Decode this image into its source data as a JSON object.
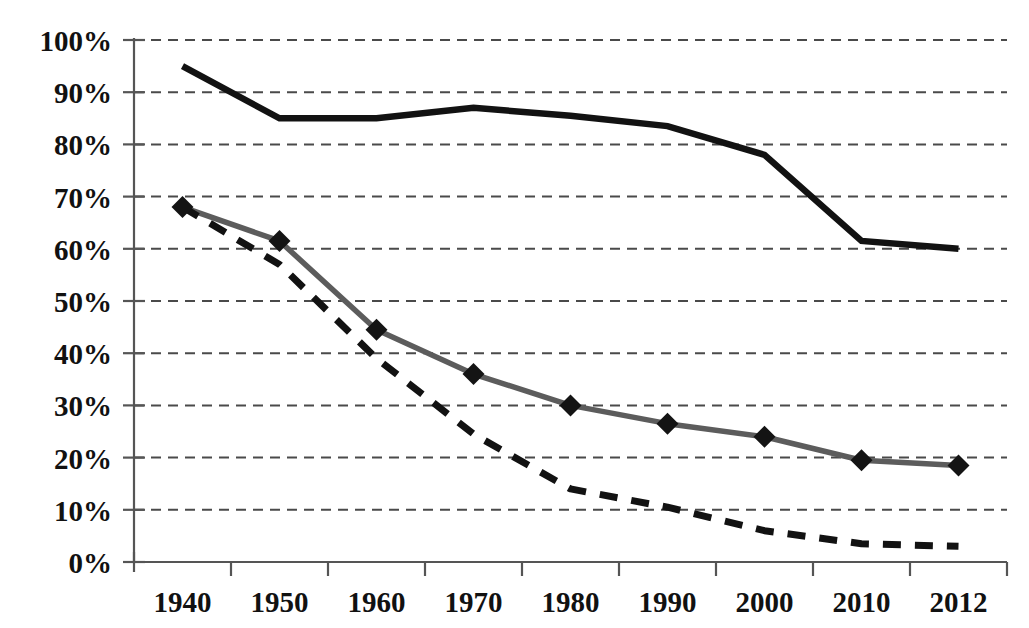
{
  "chart_data": {
    "type": "line",
    "title": "",
    "subtitle": "",
    "xlabel": "",
    "ylabel": "",
    "categories": [
      "1940",
      "1950",
      "1960",
      "1970",
      "1980",
      "1990",
      "2000",
      "2010",
      "2012"
    ],
    "x_tick_labels": [
      "1940",
      "1950",
      "1960",
      "1970",
      "1980",
      "1990",
      "2000",
      "2010",
      "2012"
    ],
    "y_tick_labels": [
      "0%",
      "10%",
      "20%",
      "30%",
      "40%",
      "50%",
      "60%",
      "70%",
      "80%",
      "90%",
      "100%"
    ],
    "y_tick_values": [
      0,
      10,
      20,
      30,
      40,
      50,
      60,
      70,
      80,
      90,
      100
    ],
    "ylim": [
      0,
      100
    ],
    "grid": true,
    "grid_orientation": "horizontal",
    "grid_style": "dashed",
    "legend": "none",
    "legend_position": "none",
    "annotations": [],
    "series": [
      {
        "name": "solid-black-upper",
        "style": "solid",
        "color": "#121212",
        "marker": "none",
        "values": [
          95,
          85,
          85,
          87,
          85.5,
          83.5,
          78,
          61.5,
          60
        ]
      },
      {
        "name": "gray-diamond-middle",
        "style": "solid",
        "color": "#5c5c5c",
        "marker": "diamond",
        "marker_color": "#141414",
        "values": [
          68,
          61.5,
          44.5,
          36,
          30,
          26.5,
          24,
          19.5,
          18.5
        ]
      },
      {
        "name": "dashed-black-lower",
        "style": "dashed",
        "color": "#121212",
        "marker": "none",
        "values": [
          68,
          57,
          39,
          24.5,
          14,
          10.5,
          6,
          3.5,
          3
        ]
      }
    ]
  },
  "axes": {
    "y_axis_color": "#555555",
    "x_axis_color": "#555555",
    "gridline_color": "#4a4a4a"
  }
}
